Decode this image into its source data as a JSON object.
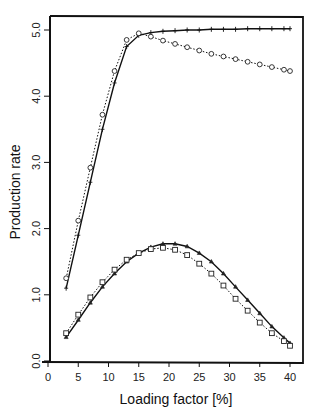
{
  "chart_data": {
    "type": "line",
    "title": "",
    "xlabel": "Loading factor [%]",
    "ylabel": "Production rate",
    "xlim": [
      0,
      41
    ],
    "ylim": [
      0,
      5.2
    ],
    "xticks": [
      0,
      5,
      10,
      15,
      20,
      25,
      30,
      35,
      40
    ],
    "xtick_labels": [
      "0",
      "5",
      "10",
      "15",
      "20",
      "25",
      "30",
      "35",
      "40"
    ],
    "yticks": [
      0,
      1,
      2,
      3,
      4,
      5
    ],
    "ytick_labels": [
      "0.0",
      "1.0",
      "2.0",
      "3.0",
      "4.0",
      "5.0"
    ],
    "grid": false,
    "legend": null,
    "series": [
      {
        "name": "upper-solid-plus",
        "style": "solid",
        "marker": "plus",
        "x": [
          3,
          5,
          7,
          9,
          11,
          13,
          15,
          17,
          19,
          21,
          23,
          25,
          27,
          29,
          31,
          33,
          35,
          37,
          39,
          40
        ],
        "y": [
          1.1,
          1.9,
          2.7,
          3.5,
          4.2,
          4.75,
          4.92,
          4.96,
          4.98,
          4.99,
          5.0,
          5.0,
          5.01,
          5.01,
          5.01,
          5.02,
          5.02,
          5.02,
          5.02,
          5.02
        ]
      },
      {
        "name": "upper-dotted-circle",
        "style": "dotted",
        "marker": "circle",
        "x": [
          3,
          5,
          7,
          9,
          11,
          13,
          15,
          17,
          19,
          21,
          23,
          25,
          27,
          29,
          31,
          33,
          35,
          37,
          39,
          40
        ],
        "y": [
          1.25,
          2.12,
          2.92,
          3.72,
          4.38,
          4.85,
          4.95,
          4.9,
          4.84,
          4.79,
          4.74,
          4.69,
          4.64,
          4.6,
          4.56,
          4.52,
          4.48,
          4.44,
          4.4,
          4.38
        ]
      },
      {
        "name": "lower-solid-triangle",
        "style": "solid",
        "marker": "triangle",
        "x": [
          3,
          5,
          7,
          9,
          11,
          13,
          15,
          17,
          19,
          21,
          23,
          25,
          27,
          29,
          31,
          33,
          35,
          37,
          39,
          40
        ],
        "y": [
          0.36,
          0.62,
          0.88,
          1.12,
          1.32,
          1.5,
          1.63,
          1.72,
          1.77,
          1.77,
          1.73,
          1.63,
          1.5,
          1.32,
          1.12,
          0.92,
          0.72,
          0.52,
          0.35,
          0.27
        ]
      },
      {
        "name": "lower-dotted-square",
        "style": "dotted",
        "marker": "square",
        "x": [
          3,
          5,
          7,
          9,
          11,
          13,
          15,
          17,
          19,
          21,
          23,
          25,
          27,
          29,
          31,
          33,
          35,
          37,
          39,
          40
        ],
        "y": [
          0.42,
          0.7,
          0.96,
          1.19,
          1.38,
          1.53,
          1.63,
          1.69,
          1.71,
          1.68,
          1.6,
          1.47,
          1.32,
          1.14,
          0.94,
          0.76,
          0.58,
          0.42,
          0.3,
          0.23
        ]
      }
    ]
  }
}
